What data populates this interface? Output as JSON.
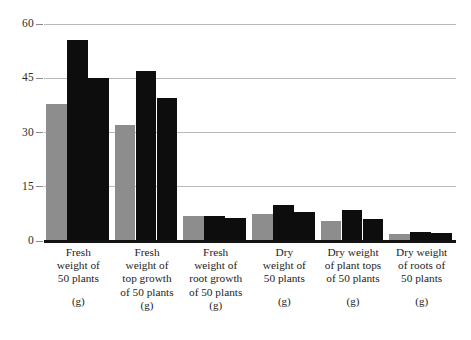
{
  "chart_data": {
    "type": "bar",
    "title": "",
    "subtitle": "",
    "xlabel": "",
    "ylabel": "",
    "ylim": [
      0,
      60
    ],
    "yticks": [
      0,
      15,
      30,
      45,
      60
    ],
    "grid": true,
    "legend": "none",
    "unit_label": "(g)",
    "categories": [
      "Fresh weight of 50 plants",
      "Fresh weight of top growth of 50 plants",
      "Fresh weight of root growth of 50 plants",
      "Dry weight of 50 plants",
      "Dry weight of plant tops of 50 plants",
      "Dry weight of roots of 50 plants"
    ],
    "category_lines": [
      [
        "Fresh",
        "weight of",
        "50 plants"
      ],
      [
        "Fresh",
        "weight of",
        "top growth",
        "of 50 plants"
      ],
      [
        "Fresh",
        "weight of",
        "root growth",
        "of 50 plants"
      ],
      [
        "Dry",
        "weight of",
        "50 plants"
      ],
      [
        "Dry weight",
        "of plant tops",
        "of 50 plants"
      ],
      [
        "Dry weight",
        "of roots of",
        "50 plants"
      ]
    ],
    "category_units": [
      "(g)",
      "(g)",
      "(g)",
      "(g)",
      "(g)",
      "(g)"
    ],
    "series": [
      {
        "name": "Series 1",
        "color": "#8d8d8d",
        "values": [
          38.0,
          32.0,
          7.0,
          7.5,
          5.5,
          2.0
        ]
      },
      {
        "name": "Series 2",
        "color": "#0d0d0d",
        "values": [
          55.5,
          47.0,
          7.0,
          10.0,
          8.5,
          2.5
        ]
      },
      {
        "name": "Series 3",
        "color": "#0d0d0d",
        "values": [
          45.0,
          39.5,
          6.5,
          8.0,
          6.0,
          2.2
        ]
      }
    ]
  },
  "axis": {
    "ytick_labels": [
      "60",
      "45",
      "30",
      "15",
      "0"
    ]
  },
  "colors": {
    "gray_bar": "#8d8d8d",
    "black_bar": "#0d0d0d",
    "gridline": "#b9b9b9",
    "baseline": "#121212",
    "background": "#ffffff",
    "text": "#1d1d1d"
  }
}
